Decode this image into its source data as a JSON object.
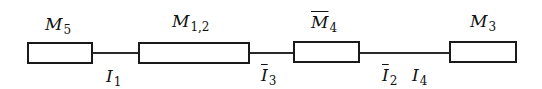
{
  "diagram": {
    "modules": [
      {
        "id": "M5",
        "base": "M",
        "sub": "5",
        "overline": false
      },
      {
        "id": "M12",
        "base": "M",
        "sub": "1,2",
        "overline": false
      },
      {
        "id": "M4bar",
        "base": "M",
        "sub": "4",
        "overline": true
      },
      {
        "id": "M3",
        "base": "M",
        "sub": "3",
        "overline": false
      }
    ],
    "connections": [
      {
        "from": "M5",
        "to": "M12",
        "labels": [
          {
            "base": "I",
            "sub": "1",
            "overline": false
          }
        ]
      },
      {
        "from": "M12",
        "to": "M4bar",
        "labels": [
          {
            "base": "I",
            "sub": "3",
            "overline": true
          }
        ]
      },
      {
        "from": "M4bar",
        "to": "M3",
        "labels": [
          {
            "base": "I",
            "sub": "2",
            "overline": true
          },
          {
            "base": "I",
            "sub": "4",
            "overline": false
          }
        ]
      }
    ]
  }
}
